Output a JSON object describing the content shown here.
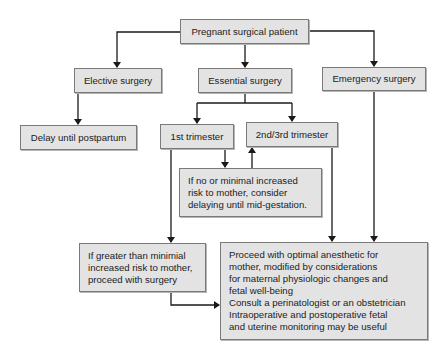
{
  "nodes": {
    "root": "Pregnant surgical patient",
    "elective": "Elective surgery",
    "essential": "Essential surgery",
    "emergency": "Emergency surgery",
    "delay": "Delay until postpartum",
    "first_trimester": "1st trimester",
    "second_third_trimester": "2nd/3rd trimester",
    "delay_mid_gestation": "If no or minimal increased\nrisk to mother, consider\ndelaying until mid-gestation.",
    "proceed_surgery": "If greater than minimial\nincreased risk to mother,\nproceed with surgery",
    "optimal_anesthetic": "Proceed with optimal anesthetic for\nmother, modified by considerations\nfor maternal physiologic changes and\nfetal well-being\nConsult a perinatologist or an obstetrician\nIntraoperative and postoperative fetal\nand uterine monitoring may be useful"
  },
  "colors": {
    "box_fill": "#e3e3e3",
    "box_border": "#7a7a7a",
    "line": "#1a1a1a"
  }
}
